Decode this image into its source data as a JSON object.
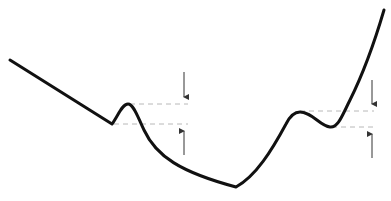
{
  "diagram": {
    "type": "potential-energy-curve",
    "colors": {
      "curve": "#111111",
      "dashed": "#b0b0b0",
      "arrow": "#333333",
      "background": "#ffffff"
    },
    "curve": {
      "description": "Descending line with a small bump (metastable well) leading into a deep minimum, then rising with a second bump (metastable well) before climbing steeply",
      "points": {
        "start": [
          10,
          60
        ],
        "left_well_min": [
          112,
          124
        ],
        "left_bump_max": [
          128,
          104
        ],
        "global_min": [
          236,
          187
        ],
        "right_bump_max": [
          298,
          112
        ],
        "right_well_min": [
          330,
          127
        ],
        "end": [
          384,
          10
        ]
      }
    },
    "markers": [
      {
        "name": "left-barrier-height",
        "upper_level_y": 104,
        "lower_level_y": 124,
        "arrow_x": 184
      },
      {
        "name": "right-barrier-height",
        "upper_level_y": 111,
        "lower_level_y": 127,
        "arrow_x": 372
      }
    ]
  }
}
